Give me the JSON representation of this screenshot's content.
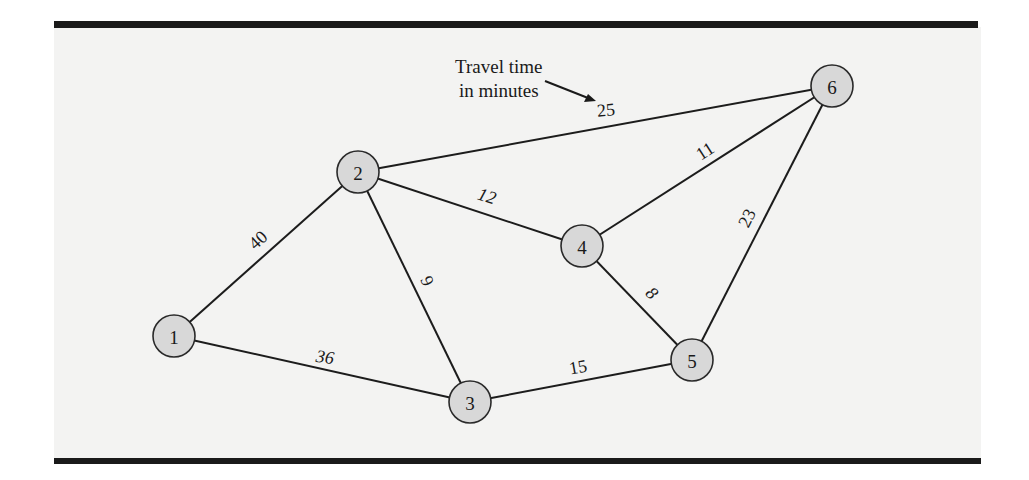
{
  "figure": {
    "annotation": {
      "line1": "Travel time",
      "line2": "in minutes",
      "points_to_edge": "2-6"
    },
    "nodes": [
      {
        "id": "1",
        "label": "1",
        "x": 174,
        "y": 336
      },
      {
        "id": "2",
        "label": "2",
        "x": 358,
        "y": 172
      },
      {
        "id": "3",
        "label": "3",
        "x": 470,
        "y": 402
      },
      {
        "id": "4",
        "label": "4",
        "x": 582,
        "y": 246
      },
      {
        "id": "5",
        "label": "5",
        "x": 692,
        "y": 360
      },
      {
        "id": "6",
        "label": "6",
        "x": 832,
        "y": 86
      }
    ],
    "edges": [
      {
        "from": "1",
        "to": "2",
        "weight": "40"
      },
      {
        "from": "1",
        "to": "3",
        "weight": "36"
      },
      {
        "from": "2",
        "to": "3",
        "weight": "6"
      },
      {
        "from": "2",
        "to": "4",
        "weight": "12"
      },
      {
        "from": "2",
        "to": "6",
        "weight": "25"
      },
      {
        "from": "3",
        "to": "5",
        "weight": "15"
      },
      {
        "from": "4",
        "to": "5",
        "weight": "8"
      },
      {
        "from": "4",
        "to": "6",
        "weight": "11"
      },
      {
        "from": "5",
        "to": "6",
        "weight": "23"
      }
    ],
    "colors": {
      "panel_background": "#f3f3f2",
      "node_fill": "#d8d8d8",
      "stroke": "#1c1c1c"
    }
  }
}
